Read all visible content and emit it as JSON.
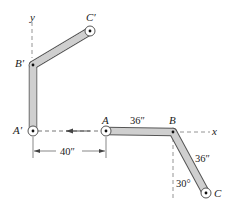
{
  "diagram": {
    "axes": {
      "x_label": "x",
      "y_label": "y"
    },
    "points": {
      "A": "A",
      "B": "B",
      "C": "C",
      "A_prime": "A′",
      "B_prime": "B′",
      "C_prime": "C′"
    },
    "dimensions": {
      "AB_length": "36″",
      "BC_length": "36″",
      "BC_angle": "30°",
      "displacement": "40″"
    },
    "colors": {
      "link_fill": "#cfcfcf",
      "link_stroke": "#555555",
      "line": "#333333",
      "dashed": "#777777"
    }
  }
}
